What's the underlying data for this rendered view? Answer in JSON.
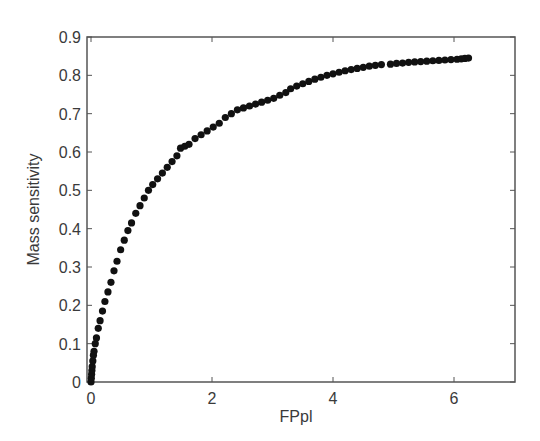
{
  "chart_data": {
    "type": "scatter",
    "title": "",
    "xlabel": "FPpl",
    "ylabel": "Mass sensitivity",
    "xlim": [
      0,
      7
    ],
    "ylim": [
      0,
      0.9
    ],
    "xticks": [
      0,
      2,
      4,
      6
    ],
    "yticks": [
      0,
      0.1,
      0.2,
      0.3,
      0.4,
      0.5,
      0.6,
      0.7,
      0.8,
      0.9
    ],
    "xtick_labels": [
      "0",
      "2",
      "4",
      "6"
    ],
    "ytick_labels": [
      "0",
      "0.1",
      "0.2",
      "0.3",
      "0.4",
      "0.5",
      "0.6",
      "0.7",
      "0.8",
      "0.9"
    ],
    "grid": false,
    "legend": null,
    "marker_color": "#111111",
    "series": [
      {
        "name": "Mass sensitivity vs FPpl",
        "x": [
          0,
          0.005,
          0.01,
          0.015,
          0.02,
          0.03,
          0.04,
          0.05,
          0.07,
          0.09,
          0.12,
          0.15,
          0.19,
          0.23,
          0.28,
          0.33,
          0.38,
          0.43,
          0.49,
          0.55,
          0.61,
          0.67,
          0.74,
          0.81,
          0.88,
          0.95,
          1.02,
          1.1,
          1.18,
          1.26,
          1.34,
          1.42,
          1.48,
          1.55,
          1.62,
          1.72,
          1.82,
          1.92,
          2.02,
          2.12,
          2.22,
          2.32,
          2.42,
          2.52,
          2.62,
          2.72,
          2.82,
          2.92,
          3.02,
          3.12,
          3.22,
          3.3,
          3.4,
          3.5,
          3.6,
          3.7,
          3.8,
          3.9,
          4.0,
          4.1,
          4.2,
          4.3,
          4.4,
          4.5,
          4.6,
          4.7,
          4.8,
          4.95,
          5.05,
          5.15,
          5.25,
          5.35,
          5.45,
          5.55,
          5.65,
          5.75,
          5.85,
          5.95,
          6.05,
          6.12,
          6.18,
          6.24
        ],
        "y": [
          0,
          0.01,
          0.02,
          0.03,
          0.04,
          0.055,
          0.07,
          0.08,
          0.1,
          0.115,
          0.14,
          0.16,
          0.185,
          0.21,
          0.235,
          0.26,
          0.29,
          0.315,
          0.345,
          0.37,
          0.395,
          0.415,
          0.44,
          0.46,
          0.48,
          0.5,
          0.515,
          0.53,
          0.545,
          0.56,
          0.575,
          0.59,
          0.61,
          0.615,
          0.62,
          0.635,
          0.645,
          0.655,
          0.665,
          0.675,
          0.69,
          0.7,
          0.71,
          0.715,
          0.72,
          0.725,
          0.73,
          0.735,
          0.74,
          0.748,
          0.755,
          0.765,
          0.772,
          0.778,
          0.784,
          0.79,
          0.795,
          0.8,
          0.804,
          0.808,
          0.812,
          0.815,
          0.818,
          0.821,
          0.824,
          0.826,
          0.828,
          0.829,
          0.831,
          0.832,
          0.834,
          0.835,
          0.836,
          0.837,
          0.838,
          0.839,
          0.84,
          0.841,
          0.842,
          0.843,
          0.844,
          0.845
        ]
      }
    ]
  },
  "plot_area": {
    "left": 87,
    "top": 37,
    "right": 515,
    "bottom": 382,
    "x0_px": 91,
    "px_per_x": 60.5
  },
  "colors": {
    "axis": "#555555",
    "marker": "#111111",
    "text": "#3a3a3a",
    "background": "#ffffff"
  }
}
